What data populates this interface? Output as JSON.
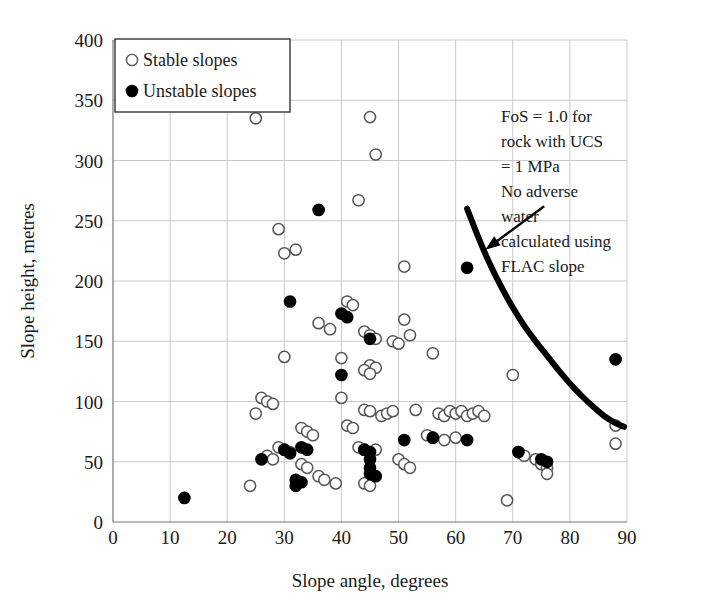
{
  "chart_data": {
    "type": "scatter",
    "title": "",
    "xlabel": "Slope angle, degrees",
    "ylabel": "Slope height, metres",
    "xlim": [
      0,
      90
    ],
    "ylim": [
      0,
      400
    ],
    "xticks": [
      0,
      10,
      20,
      30,
      40,
      50,
      60,
      70,
      80,
      90
    ],
    "yticks": [
      0,
      50,
      100,
      150,
      200,
      250,
      300,
      350,
      400
    ],
    "grid": true,
    "legend_position": "top-left",
    "legend": [
      {
        "label": "Stable slopes",
        "marker": "open-circle"
      },
      {
        "label": "Unstable slopes",
        "marker": "filled-circle"
      }
    ],
    "series": [
      {
        "name": "Stable slopes",
        "marker": "open-circle",
        "color": "#ffffff",
        "edge_color": "#555555",
        "points": [
          [
            25,
            335
          ],
          [
            45,
            336
          ],
          [
            46,
            305
          ],
          [
            43,
            267
          ],
          [
            29,
            243
          ],
          [
            30,
            223
          ],
          [
            32,
            226
          ],
          [
            51,
            212
          ],
          [
            41,
            183
          ],
          [
            42,
            180
          ],
          [
            36,
            165
          ],
          [
            38,
            160
          ],
          [
            44,
            158
          ],
          [
            45,
            155
          ],
          [
            46,
            152
          ],
          [
            49,
            150
          ],
          [
            50,
            148
          ],
          [
            51,
            168
          ],
          [
            52,
            155
          ],
          [
            45,
            130
          ],
          [
            46,
            128
          ],
          [
            44,
            126
          ],
          [
            45,
            123
          ],
          [
            40,
            136
          ],
          [
            30,
            137
          ],
          [
            56,
            140
          ],
          [
            70,
            122
          ],
          [
            88,
            80
          ],
          [
            88,
            65
          ],
          [
            25,
            90
          ],
          [
            26,
            103
          ],
          [
            27,
            100
          ],
          [
            28,
            98
          ],
          [
            40,
            103
          ],
          [
            44,
            93
          ],
          [
            45,
            92
          ],
          [
            53,
            93
          ],
          [
            57,
            90
          ],
          [
            58,
            88
          ],
          [
            59,
            92
          ],
          [
            60,
            90
          ],
          [
            61,
            92
          ],
          [
            62,
            88
          ],
          [
            63,
            90
          ],
          [
            64,
            92
          ],
          [
            65,
            88
          ],
          [
            55,
            72
          ],
          [
            56,
            70
          ],
          [
            58,
            68
          ],
          [
            60,
            70
          ],
          [
            33,
            78
          ],
          [
            34,
            75
          ],
          [
            35,
            72
          ],
          [
            41,
            80
          ],
          [
            42,
            78
          ],
          [
            43,
            62
          ],
          [
            44,
            60
          ],
          [
            45,
            58
          ],
          [
            46,
            60
          ],
          [
            50,
            52
          ],
          [
            51,
            48
          ],
          [
            52,
            45
          ],
          [
            29,
            62
          ],
          [
            30,
            60
          ],
          [
            31,
            58
          ],
          [
            27,
            55
          ],
          [
            28,
            52
          ],
          [
            24,
            30
          ],
          [
            36,
            38
          ],
          [
            37,
            35
          ],
          [
            39,
            32
          ],
          [
            44,
            32
          ],
          [
            45,
            30
          ],
          [
            69,
            18
          ],
          [
            71,
            58
          ],
          [
            72,
            55
          ],
          [
            74,
            52
          ],
          [
            75,
            48
          ],
          [
            76,
            45
          ],
          [
            76,
            40
          ],
          [
            33,
            48
          ],
          [
            34,
            45
          ],
          [
            47,
            88
          ],
          [
            48,
            90
          ],
          [
            49,
            92
          ]
        ]
      },
      {
        "name": "Unstable slopes",
        "marker": "filled-circle",
        "color": "#000000",
        "edge_color": "#000000",
        "points": [
          [
            36,
            259
          ],
          [
            62,
            211
          ],
          [
            31,
            183
          ],
          [
            40,
            173
          ],
          [
            41,
            170
          ],
          [
            45,
            152
          ],
          [
            88,
            135
          ],
          [
            40,
            122
          ],
          [
            12.5,
            20
          ],
          [
            26,
            52
          ],
          [
            30,
            60
          ],
          [
            31,
            57
          ],
          [
            32,
            35
          ],
          [
            32,
            30
          ],
          [
            33,
            33
          ],
          [
            44,
            60
          ],
          [
            45,
            58
          ],
          [
            45,
            52
          ],
          [
            45,
            45
          ],
          [
            45,
            40
          ],
          [
            46,
            38
          ],
          [
            51,
            68
          ],
          [
            56,
            70
          ],
          [
            62,
            68
          ],
          [
            71,
            58
          ],
          [
            75,
            52
          ],
          [
            76,
            50
          ],
          [
            33,
            62
          ],
          [
            34,
            60
          ]
        ]
      }
    ],
    "curve": {
      "label": "FoS = 1.0 envelope",
      "color": "#000000",
      "points": [
        [
          62,
          260
        ],
        [
          64,
          236
        ],
        [
          66,
          214
        ],
        [
          68,
          195
        ],
        [
          70,
          178
        ],
        [
          72,
          163
        ],
        [
          74,
          150
        ],
        [
          76,
          138
        ],
        [
          78,
          126
        ],
        [
          80,
          115
        ],
        [
          82,
          105
        ],
        [
          84,
          96
        ],
        [
          86,
          88
        ],
        [
          88,
          82
        ],
        [
          89.5,
          79
        ]
      ]
    },
    "annotation": {
      "lines": [
        "FoS = 1.0 for",
        "rock with UCS",
        "= 1 MPa",
        "No adverse",
        "water",
        "calculated using",
        "FLAC slope"
      ],
      "arrow_from": [
        75.5,
        262
      ],
      "arrow_to": [
        65.2,
        226
      ]
    }
  }
}
